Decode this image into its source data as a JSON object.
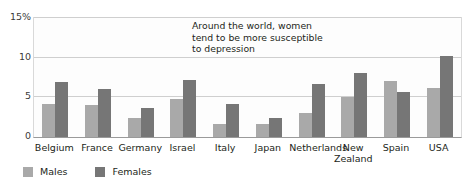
{
  "chart_data": {
    "type": "bar",
    "title": "",
    "xlabel": "",
    "ylabel": "",
    "ylim": [
      0,
      15
    ],
    "yticks": [
      "0",
      "5",
      "10",
      "15%"
    ],
    "ytick_values": [
      0,
      5,
      10,
      15
    ],
    "grid": true,
    "legend_position": "bottom-left",
    "categories": [
      "Belgium",
      "France",
      "Germany",
      "Israel",
      "Italy",
      "Japan",
      "Netherlands",
      "New Zealand",
      "Spain",
      "USA"
    ],
    "series": [
      {
        "name": "Males",
        "color": "#a9a9a9",
        "values": [
          4.1,
          4.0,
          2.4,
          4.8,
          1.7,
          1.6,
          3.0,
          5.0,
          7.1,
          6.2
        ]
      },
      {
        "name": "Females",
        "color": "#767676",
        "values": [
          6.9,
          6.0,
          3.7,
          7.2,
          4.2,
          2.4,
          6.7,
          8.1,
          5.7,
          10.2
        ]
      }
    ],
    "annotations": [
      {
        "text": "Around the world, women tend to be more susceptible to depression",
        "lines": [
          "Around the world, women",
          "tend to be more susceptible",
          "to depression"
        ]
      }
    ]
  },
  "legend": {
    "items": [
      {
        "label": "Males",
        "color": "#a9a9a9"
      },
      {
        "label": "Females",
        "color": "#767676"
      }
    ]
  },
  "colors": {
    "males": "#a9a9a9",
    "females": "#767676",
    "gridline": "#cfcfcf",
    "axis": "#9a9a9a",
    "text": "#231f20",
    "plot_background": "#fdfdfd"
  }
}
